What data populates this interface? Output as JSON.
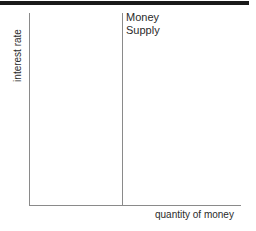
{
  "chart_data": {
    "type": "line",
    "title": "",
    "xlabel": "quantity of money",
    "ylabel": "interest rate",
    "grid": false,
    "legend": "none",
    "annotations": [
      {
        "name": "money-supply-curve-label",
        "text": "Money\nSupply",
        "line1": "Money",
        "line2": "Supply"
      }
    ],
    "series": [
      {
        "name": "Money Supply",
        "shape": "vertical-line",
        "description": "Perfectly inelastic (vertical) money supply curve at a fixed quantity of money",
        "x": [
          0.44,
          0.44
        ],
        "y": [
          0.0,
          1.0
        ]
      }
    ],
    "xlim": [
      0,
      1
    ],
    "ylim": [
      0,
      1
    ],
    "xticks": [],
    "yticks": []
  },
  "axes": {
    "y_label": "interest rate",
    "x_label": "quantity of money"
  },
  "curve": {
    "label_line1": "Money",
    "label_line2": "Supply"
  },
  "colors": {
    "background": "#ffffff",
    "axis_line": "#8a8a8a",
    "curve_line": "#8a8a8a",
    "text": "#2b2b2b",
    "top_rule": "#1a1a1a"
  }
}
